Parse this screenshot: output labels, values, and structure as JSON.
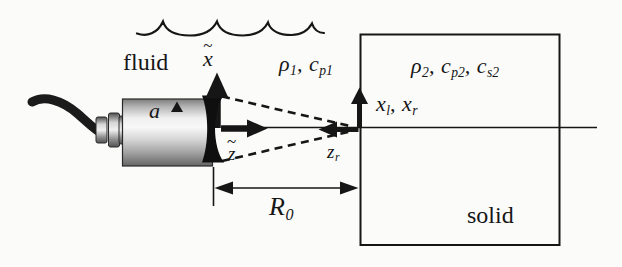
{
  "figure": {
    "type": "physics-diagram",
    "background": "#fbfbfa",
    "ink": "#161616",
    "transducer_body_colors": {
      "highlight": "#f8f8f8",
      "shadow": "#646464"
    },
    "labels": {
      "fluid": "fluid",
      "solid": "solid",
      "radius": "a",
      "x_axis": {
        "tilde": "~",
        "base": "x"
      },
      "z_axis": {
        "tilde": "~",
        "base": "z"
      },
      "medium1": {
        "p1": "ρ",
        "s1": "1",
        "p2": ", c",
        "s2": "p1"
      },
      "medium2": {
        "p1": "ρ",
        "s1": "2",
        "p2": ", c",
        "s2": "p2",
        "p3": ", c",
        "s3": "s2"
      },
      "interface_coords": {
        "p1": "x",
        "s1": "l",
        "p2": ", x",
        "s2": "r"
      },
      "zr": {
        "p1": "z",
        "s1": "r"
      },
      "r0": {
        "p1": "R",
        "s1": "0"
      }
    }
  }
}
